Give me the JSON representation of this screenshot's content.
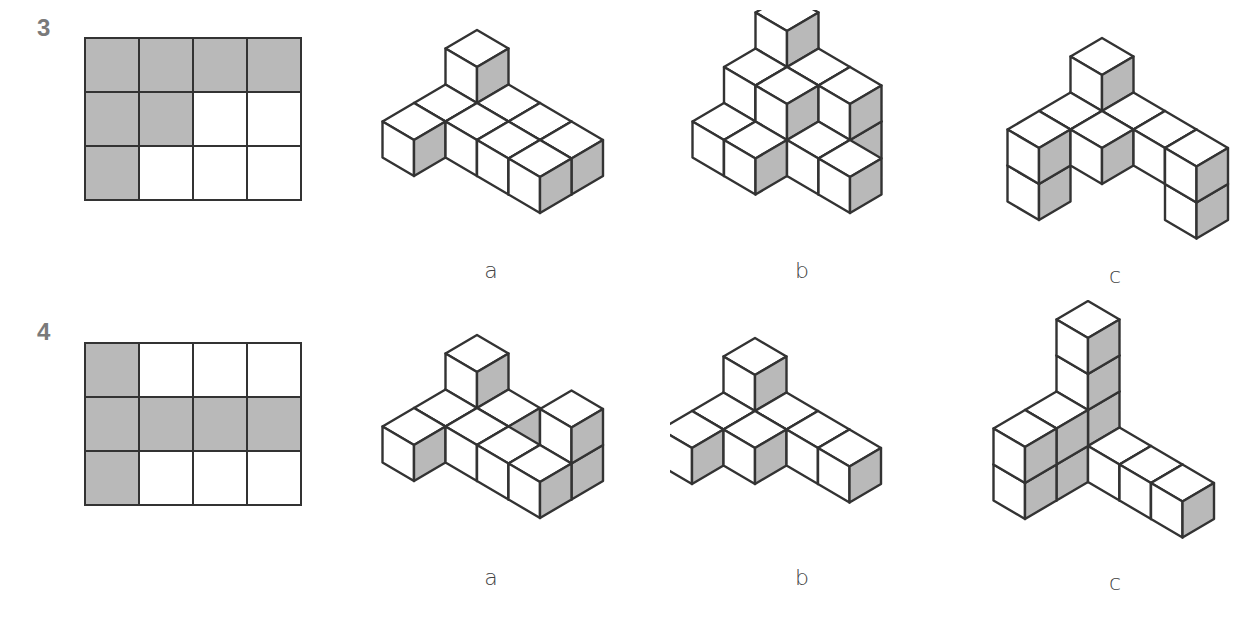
{
  "problems": [
    {
      "number": "3",
      "plan": [
        [
          1,
          1,
          1,
          1
        ],
        [
          1,
          1,
          0,
          0
        ],
        [
          1,
          0,
          0,
          0
        ]
      ],
      "options": [
        {
          "label": "a",
          "cubes": [
            [
              0,
              0,
              0
            ],
            [
              0,
              0,
              1
            ],
            [
              1,
              0,
              0
            ],
            [
              2,
              0,
              0
            ],
            [
              3,
              0,
              0
            ],
            [
              0,
              1,
              0
            ],
            [
              1,
              1,
              0
            ],
            [
              2,
              1,
              0
            ],
            [
              3,
              1,
              0
            ],
            [
              0,
              2,
              0
            ]
          ]
        },
        {
          "label": "b",
          "cubes": [
            [
              0,
              0,
              0
            ],
            [
              0,
              0,
              1
            ],
            [
              0,
              0,
              2
            ],
            [
              1,
              0,
              0
            ],
            [
              1,
              0,
              1
            ],
            [
              2,
              0,
              0
            ],
            [
              2,
              0,
              1
            ],
            [
              0,
              1,
              0
            ],
            [
              0,
              1,
              1
            ],
            [
              1,
              1,
              0
            ],
            [
              1,
              1,
              1
            ],
            [
              2,
              1,
              0
            ],
            [
              3,
              1,
              0
            ],
            [
              0,
              2,
              0
            ],
            [
              1,
              2,
              0
            ]
          ]
        },
        {
          "label": "c",
          "cubes": [
            [
              0,
              0,
              0
            ],
            [
              0,
              0,
              1
            ],
            [
              1,
              0,
              0
            ],
            [
              2,
              0,
              0
            ],
            [
              3,
              0,
              0
            ],
            [
              3,
              0,
              -1
            ],
            [
              0,
              1,
              0
            ],
            [
              1,
              1,
              0
            ],
            [
              0,
              2,
              0
            ],
            [
              0,
              2,
              -1
            ]
          ]
        }
      ]
    },
    {
      "number": "4",
      "plan": [
        [
          1,
          0,
          0,
          0
        ],
        [
          1,
          1,
          1,
          1
        ],
        [
          1,
          0,
          0,
          0
        ]
      ],
      "options": [
        {
          "label": "a",
          "cubes": [
            [
              0,
              0,
              0
            ],
            [
              0,
              0,
              1
            ],
            [
              1,
              0,
              0
            ],
            [
              0,
              1,
              0
            ],
            [
              1,
              1,
              0
            ],
            [
              2,
              1,
              0
            ],
            [
              3,
              1,
              0
            ],
            [
              3,
              0,
              0
            ],
            [
              3,
              0,
              1
            ],
            [
              0,
              2,
              0
            ]
          ]
        },
        {
          "label": "b",
          "cubes": [
            [
              0,
              0,
              0
            ],
            [
              0,
              0,
              1
            ],
            [
              1,
              0,
              0
            ],
            [
              2,
              0,
              0
            ],
            [
              3,
              0,
              0
            ],
            [
              0,
              1,
              0
            ],
            [
              1,
              1,
              0
            ],
            [
              0,
              2,
              0
            ]
          ]
        },
        {
          "label": "c",
          "cubes": [
            [
              0,
              0,
              0
            ],
            [
              0,
              0,
              1
            ],
            [
              0,
              0,
              2
            ],
            [
              0,
              0,
              3
            ],
            [
              1,
              0,
              0
            ],
            [
              2,
              0,
              0
            ],
            [
              3,
              0,
              0
            ],
            [
              0,
              1,
              0
            ],
            [
              0,
              1,
              1
            ],
            [
              0,
              2,
              0
            ],
            [
              0,
              2,
              1
            ]
          ]
        }
      ]
    }
  ],
  "colors": {
    "shade": "#b9b9b9",
    "line": "#333333",
    "face": "#ffffff",
    "number": "#7a7a7a"
  }
}
